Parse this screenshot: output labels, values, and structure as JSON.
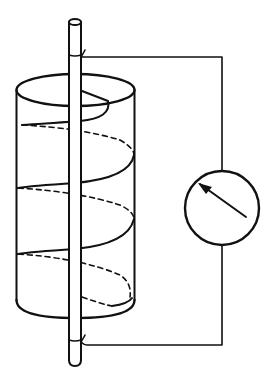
{
  "diagram": {
    "components": [
      {
        "id": "central-rod",
        "label": ""
      },
      {
        "id": "cylinder",
        "label": ""
      },
      {
        "id": "helical-coil",
        "label": ""
      },
      {
        "id": "meter",
        "label": ""
      },
      {
        "id": "connecting-wire",
        "label": ""
      }
    ],
    "colors": {
      "ink": "#111111",
      "background": "#ffffff"
    }
  }
}
